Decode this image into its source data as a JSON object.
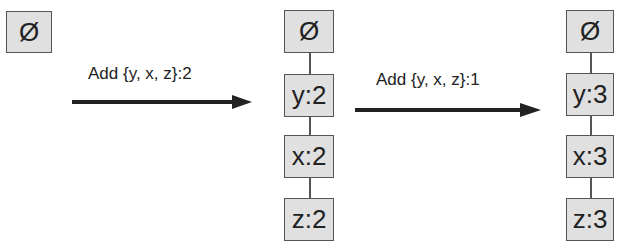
{
  "diagram": {
    "stages": [
      {
        "nodes": [
          "Ø"
        ]
      },
      {
        "nodes": [
          "Ø",
          "y:2",
          "x:2",
          "z:2"
        ]
      },
      {
        "nodes": [
          "Ø",
          "y:3",
          "x:3",
          "z:3"
        ]
      }
    ],
    "transitions": [
      {
        "label": "Add {y, x, z}:2"
      },
      {
        "label": "Add {y, x, z}:1"
      }
    ],
    "colors": {
      "node_fill": "#e0e0e0",
      "node_border": "#555555",
      "arrow": "#222222"
    }
  }
}
